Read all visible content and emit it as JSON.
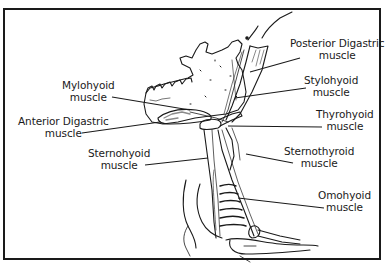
{
  "diagram": {
    "title": "",
    "labels": [
      {
        "id": "posterior-digastric",
        "line1": "Posterior Digastric",
        "line2": "muscle"
      },
      {
        "id": "stylohyoid",
        "line1": "Stylohyoid",
        "line2": "muscle"
      },
      {
        "id": "thyrohyoid",
        "line1": "Thyrohyoid",
        "line2": "muscle"
      },
      {
        "id": "sternothyroid",
        "line1": "Sternothyroid",
        "line2": "muscle"
      },
      {
        "id": "omohyoid",
        "line1": "Omohyoid",
        "line2": "muscle"
      },
      {
        "id": "mylohyoid",
        "line1": "Mylohyoid",
        "line2": "muscle"
      },
      {
        "id": "anterior-digastric",
        "line1": "Anterior Digastric",
        "line2": "muscle"
      },
      {
        "id": "sternohyoid",
        "line1": "Sternohyoid",
        "line2": "muscle"
      }
    ],
    "colors": {
      "ink": "#1a1a1a",
      "background": "#ffffff",
      "shading": "#8a8a8a"
    }
  }
}
